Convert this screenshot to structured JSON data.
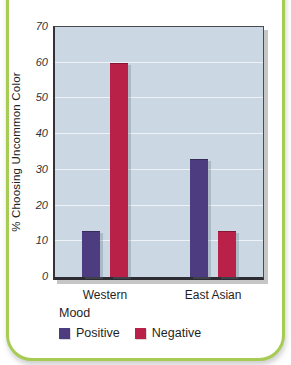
{
  "figure": {
    "border_color": "#a6cc53"
  },
  "chart_data": {
    "type": "bar",
    "title": "",
    "categories": [
      "Western",
      "East Asian"
    ],
    "series": [
      {
        "name": "Positive",
        "color": "#4e3c80",
        "values": [
          13,
          33
        ]
      },
      {
        "name": "Negative",
        "color": "#b92148",
        "values": [
          60,
          13
        ]
      }
    ],
    "xlabel": "",
    "ylabel": "% Choosing Uncommon Color",
    "ylim": [
      0,
      70
    ],
    "yticks": [
      0,
      10,
      20,
      30,
      40,
      50,
      60,
      70
    ],
    "grid": true,
    "gridline_color": "#eef2f6",
    "plot_bg": "#cbd8e4",
    "legend_title": "Mood",
    "legend_position": "bottom-left"
  }
}
